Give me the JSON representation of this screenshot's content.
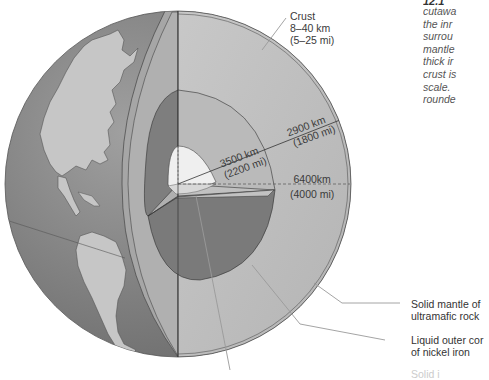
{
  "figure": {
    "caption_number": "12.1",
    "caption_lines": [
      "cutawa",
      "the inr",
      "surrou",
      "mantle",
      "thick ir",
      "crust is",
      "scale.",
      "rounde"
    ]
  },
  "labels": {
    "crust": {
      "name": "Crust",
      "km": "8–40 km",
      "mi": "(5–25 mi)"
    },
    "mantle_depth": {
      "km": "2900 km",
      "mi": "(1800 mi)"
    },
    "core_radius": {
      "km": "3500 km",
      "mi": "(2200 mi)"
    },
    "earth_radius": {
      "km": "6400km",
      "mi": "(4000 mi)"
    }
  },
  "callouts": {
    "mantle": {
      "line1": "Solid mantle of",
      "line2": "ultramafic rock"
    },
    "outer_core": {
      "line1": "Liquid outer cor",
      "line2": "of nickel iron"
    },
    "inner_core": {
      "line1": "Solid i"
    }
  },
  "colors": {
    "ocean": "#8c8c8c",
    "land": "#c4c4c4",
    "mantle": "#bdbdbd",
    "outer_core": "#7a7a7a",
    "inner_core": "#ececec",
    "crust_band": "#a8a8a8",
    "leader_line": "#9a9a9a"
  }
}
